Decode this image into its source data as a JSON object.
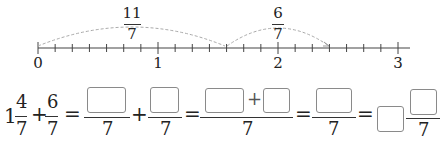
{
  "number_line": {
    "tick_labels": [
      "0",
      "1",
      "2",
      "3"
    ],
    "subdivisions_per_unit": 7,
    "arc1": {
      "label_num": "11",
      "label_den": "7",
      "from": 0,
      "to": "11/7"
    },
    "arc2": {
      "label_num": "6",
      "label_den": "7",
      "from": "11/7",
      "to": "17/7"
    },
    "line_color": "#444444",
    "arc_color": "#aaaaaa"
  },
  "equation": {
    "whole": "1",
    "frac1": {
      "num": "4",
      "den": "7"
    },
    "op_plus": "+",
    "frac2": {
      "num": "6",
      "den": "7"
    },
    "op_equals": "=",
    "denominator": "7",
    "blank_boxes": 7
  }
}
